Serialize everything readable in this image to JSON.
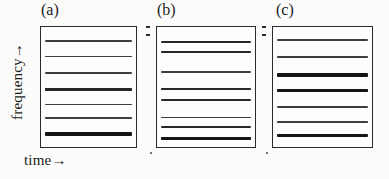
{
  "figure": {
    "xlabel": "time→",
    "ylabel": "frequency→",
    "panel_labels": [
      "(a)",
      "(b)",
      "(c)"
    ],
    "line_color": "#151515",
    "frame_color": "#2b2b2b",
    "background_color": "#fdfdfc"
  },
  "chart_data": {
    "type": "line",
    "title": "",
    "subtitle": "",
    "xlabel": "time→",
    "ylabel": "frequency→",
    "grid": false,
    "legend": "none",
    "axes_have_tick_labels": false,
    "xlim": [
      0,
      1
    ],
    "ylim": [
      0,
      1
    ],
    "panels": [
      {
        "label": "(a)",
        "n_lines": 7,
        "note": "evenly spaced lines; lowest-frequency line strongest, fourth line moderately strong",
        "lines": [
          {
            "index": 1,
            "y_frac": 0.115,
            "thickness_px": 1.5,
            "intensity": "weak"
          },
          {
            "index": 2,
            "y_frac": 0.245,
            "thickness_px": 1.6,
            "intensity": "weak"
          },
          {
            "index": 3,
            "y_frac": 0.385,
            "thickness_px": 1.7,
            "intensity": "medium"
          },
          {
            "index": 4,
            "y_frac": 0.52,
            "thickness_px": 2.3,
            "intensity": "strong"
          },
          {
            "index": 5,
            "y_frac": 0.645,
            "thickness_px": 1.5,
            "intensity": "weak"
          },
          {
            "index": 6,
            "y_frac": 0.76,
            "thickness_px": 1.8,
            "intensity": "medium"
          },
          {
            "index": 7,
            "y_frac": 0.89,
            "thickness_px": 3.6,
            "intensity": "very strong"
          }
        ]
      },
      {
        "label": "(b)",
        "n_lines": 7,
        "note": "lines grouped in close pairs (1-2, 4-5, 6-7); lowest-frequency line strongest",
        "lines": [
          {
            "index": 1,
            "y_frac": 0.125,
            "thickness_px": 2.3,
            "intensity": "strong"
          },
          {
            "index": 2,
            "y_frac": 0.21,
            "thickness_px": 2.3,
            "intensity": "strong"
          },
          {
            "index": 3,
            "y_frac": 0.375,
            "thickness_px": 1.5,
            "intensity": "weak"
          },
          {
            "index": 4,
            "y_frac": 0.52,
            "thickness_px": 2.0,
            "intensity": "medium"
          },
          {
            "index": 5,
            "y_frac": 0.605,
            "thickness_px": 2.0,
            "intensity": "medium"
          },
          {
            "index": 6,
            "y_frac": 0.755,
            "thickness_px": 1.5,
            "intensity": "weak"
          },
          {
            "index": 7,
            "y_frac": 0.83,
            "thickness_px": 2.2,
            "intensity": "strong"
          },
          {
            "index": 8,
            "y_frac": 0.93,
            "thickness_px": 3.6,
            "intensity": "very strong"
          }
        ]
      },
      {
        "label": "(c)",
        "n_lines": 7,
        "note": "third and fourth lines are the strongest; lowest-frequency line also strong",
        "lines": [
          {
            "index": 1,
            "y_frac": 0.11,
            "thickness_px": 1.5,
            "intensity": "weak"
          },
          {
            "index": 2,
            "y_frac": 0.25,
            "thickness_px": 1.7,
            "intensity": "medium"
          },
          {
            "index": 3,
            "y_frac": 0.4,
            "thickness_px": 3.6,
            "intensity": "very strong"
          },
          {
            "index": 4,
            "y_frac": 0.53,
            "thickness_px": 3.6,
            "intensity": "very strong"
          },
          {
            "index": 5,
            "y_frac": 0.665,
            "thickness_px": 1.6,
            "intensity": "weak"
          },
          {
            "index": 6,
            "y_frac": 0.79,
            "thickness_px": 1.6,
            "intensity": "weak"
          },
          {
            "index": 7,
            "y_frac": 0.905,
            "thickness_px": 3.2,
            "intensity": "very strong"
          }
        ]
      }
    ]
  }
}
